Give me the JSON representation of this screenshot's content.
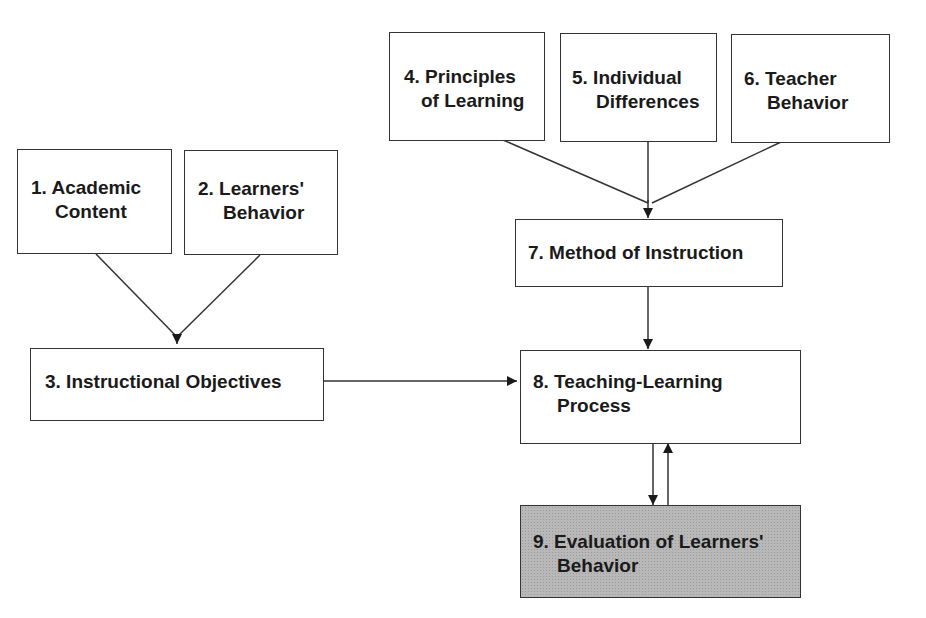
{
  "diagram": {
    "title": "",
    "nodes": [
      {
        "id": 1,
        "line1": "1. Academic",
        "line2": "Content"
      },
      {
        "id": 2,
        "line1": "2. Learners'",
        "line2": "Behavior"
      },
      {
        "id": 3,
        "line1": "3. Instructional Objectives",
        "line2": ""
      },
      {
        "id": 4,
        "line1": "4. Principles",
        "line2": "of Learning"
      },
      {
        "id": 5,
        "line1": "5. Individual",
        "line2": "Differences"
      },
      {
        "id": 6,
        "line1": "6. Teacher",
        "line2": "Behavior"
      },
      {
        "id": 7,
        "line1": "7. Method of Instruction",
        "line2": ""
      },
      {
        "id": 8,
        "line1": "8. Teaching-Learning",
        "line2": "Process"
      },
      {
        "id": 9,
        "line1": "9. Evaluation of Learners'",
        "line2": "Behavior"
      }
    ],
    "edges": [
      {
        "from": 1,
        "to": 3
      },
      {
        "from": 2,
        "to": 3
      },
      {
        "from": 3,
        "to": 8
      },
      {
        "from": 4,
        "to": 7
      },
      {
        "from": 5,
        "to": 7
      },
      {
        "from": 6,
        "to": 7
      },
      {
        "from": 7,
        "to": 8
      },
      {
        "from": 8,
        "to": 9
      },
      {
        "from": 9,
        "to": 8
      }
    ],
    "colors": {
      "line": "#333333",
      "shaded_box": "#b8b8b8"
    }
  }
}
